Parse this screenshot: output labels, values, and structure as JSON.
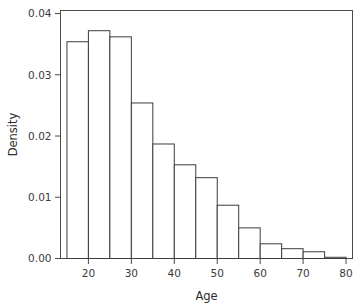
{
  "chart_data": {
    "type": "bar",
    "subtype": "histogram",
    "title": "",
    "xlabel": "Age",
    "ylabel": "Density",
    "xlim": [
      13.5,
      81.5
    ],
    "ylim": [
      0,
      0.0405
    ],
    "grid": false,
    "legend": "none",
    "bin_width": 5,
    "bin_edges": [
      15,
      20,
      25,
      30,
      35,
      40,
      45,
      50,
      55,
      60,
      65,
      70,
      75,
      80
    ],
    "categories": [
      "15-20",
      "20-25",
      "25-30",
      "30-35",
      "35-40",
      "40-45",
      "45-50",
      "50-55",
      "55-60",
      "60-65",
      "65-70",
      "70-75",
      "75-80"
    ],
    "values": [
      0.0354,
      0.0372,
      0.0362,
      0.0254,
      0.0187,
      0.0153,
      0.0132,
      0.0087,
      0.005,
      0.0024,
      0.0016,
      0.0011,
      0.0002
    ],
    "xticks": [
      20,
      30,
      40,
      50,
      60,
      70,
      80
    ],
    "xtick_labels": [
      "20",
      "30",
      "40",
      "50",
      "60",
      "70",
      "80"
    ],
    "yticks": [
      0.0,
      0.01,
      0.02,
      0.03,
      0.04
    ],
    "ytick_labels": [
      "0.00",
      "0.01",
      "0.02",
      "0.03",
      "0.04"
    ],
    "bar_fill_color": "#ffffff",
    "bar_edge_color": "#3c3c3c",
    "axis_color": "#4a4a4a",
    "text_color": "#2b2b2b",
    "background_color": "#ffffff"
  }
}
